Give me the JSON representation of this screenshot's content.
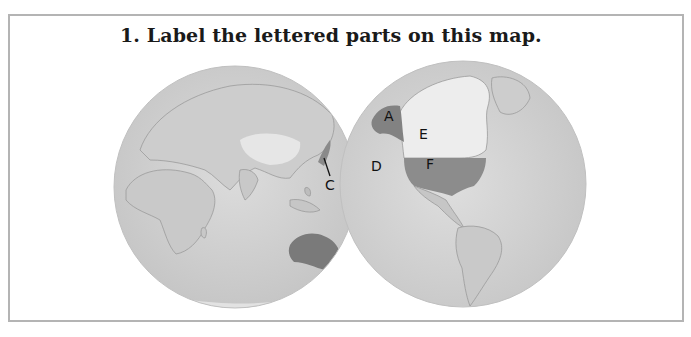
{
  "question": {
    "number": "1.",
    "text": "Label the lettered parts on this map."
  },
  "map": {
    "type": "two-hemisphere world map",
    "hemispheres": [
      "eastern",
      "western"
    ],
    "labels": [
      {
        "letter": "A",
        "feature": "Alaska (shaded)"
      },
      {
        "letter": "C",
        "feature": "Japan region (pointer line)"
      },
      {
        "letter": "D",
        "feature": "Pacific Ocean"
      },
      {
        "letter": "E",
        "feature": "Canada (light)"
      },
      {
        "letter": "F",
        "feature": "United States (shaded)"
      }
    ],
    "shaded_unlabeled": [
      "Australia"
    ],
    "colors": {
      "ocean": "#d2d2d2",
      "land": "#c4c4c4",
      "highlight_dark": "#7e7e7e",
      "highlight_light": "#ececec",
      "frame_border": "#b4b4b4"
    }
  }
}
